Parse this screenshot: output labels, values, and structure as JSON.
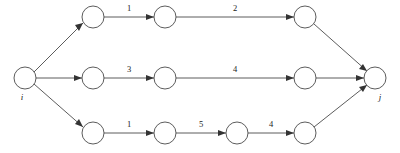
{
  "diagram": {
    "type": "directed-graph",
    "colors": {
      "background": "#ffffff",
      "stroke": "#4a4a4a",
      "arrow": "#333333",
      "node_fill": "#ffffff",
      "text": "#1a1a1a"
    },
    "node_radius": 11,
    "endpoints": {
      "source": {
        "id": "i",
        "label": "i",
        "x": 25,
        "y": 78
      },
      "sink": {
        "id": "j",
        "label": "j",
        "x": 375,
        "y": 78
      }
    },
    "paths": [
      {
        "name": "top-path",
        "y": 17,
        "nodes": [
          {
            "id": "t1",
            "x": 93,
            "y": 17
          },
          {
            "id": "t2",
            "x": 165,
            "y": 17
          },
          {
            "id": "t3",
            "x": 305,
            "y": 17
          }
        ],
        "edges": [
          {
            "from": "i",
            "to": "t1",
            "label": ""
          },
          {
            "from": "t1",
            "to": "t2",
            "label": "1"
          },
          {
            "from": "t2",
            "to": "t3",
            "label": "2"
          },
          {
            "from": "t3",
            "to": "j",
            "label": ""
          }
        ]
      },
      {
        "name": "middle-path",
        "y": 78,
        "nodes": [
          {
            "id": "m1",
            "x": 93,
            "y": 78
          },
          {
            "id": "m2",
            "x": 165,
            "y": 78
          },
          {
            "id": "m3",
            "x": 305,
            "y": 78
          }
        ],
        "edges": [
          {
            "from": "i",
            "to": "m1",
            "label": ""
          },
          {
            "from": "m1",
            "to": "m2",
            "label": "3"
          },
          {
            "from": "m2",
            "to": "m3",
            "label": "4"
          },
          {
            "from": "m3",
            "to": "j",
            "label": ""
          }
        ]
      },
      {
        "name": "bottom-path",
        "y": 133,
        "nodes": [
          {
            "id": "b1",
            "x": 93,
            "y": 133
          },
          {
            "id": "b2",
            "x": 165,
            "y": 133
          },
          {
            "id": "b3",
            "x": 237,
            "y": 133
          },
          {
            "id": "b4",
            "x": 305,
            "y": 133
          }
        ],
        "edges": [
          {
            "from": "i",
            "to": "b1",
            "label": ""
          },
          {
            "from": "b1",
            "to": "b2",
            "label": "1"
          },
          {
            "from": "b2",
            "to": "b3",
            "label": "5"
          },
          {
            "from": "b3",
            "to": "b4",
            "label": "4"
          },
          {
            "from": "b4",
            "to": "j",
            "label": ""
          }
        ]
      }
    ],
    "edge_labels": {
      "top_1": "1",
      "top_2": "2",
      "middle_1": "3",
      "middle_2": "4",
      "bottom_1": "1",
      "bottom_2": "5",
      "bottom_3": "4"
    }
  }
}
